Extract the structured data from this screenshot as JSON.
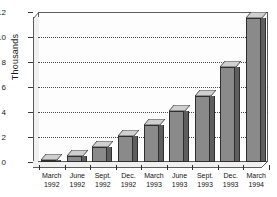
{
  "chart_data": {
    "type": "bar",
    "title": "",
    "subtitle": "",
    "xlabel": "",
    "ylabel": "Thousands",
    "categories": [
      "March\n1992",
      "June\n1992",
      "Sept.\n1992",
      "Dec.\n1992",
      "March\n1993",
      "June\n1993",
      "Sept.\n1993",
      "Dec.\n1993",
      "March\n1994"
    ],
    "category_lines": [
      [
        "March",
        "1992"
      ],
      [
        "June",
        "1992"
      ],
      [
        "Sept.",
        "1992"
      ],
      [
        "Dec.",
        "1992"
      ],
      [
        "March",
        "1993"
      ],
      [
        "June",
        "1993"
      ],
      [
        "Sept.",
        "1993"
      ],
      [
        "Dec.",
        "1993"
      ],
      [
        "March",
        "1994"
      ]
    ],
    "values": [
      0.2,
      0.5,
      1.2,
      2.1,
      3.0,
      4.1,
      5.3,
      7.6,
      11.5
    ],
    "ylim": [
      0,
      12
    ],
    "yticks": [
      0,
      2,
      4,
      6,
      8,
      10,
      12
    ],
    "ytick_labels": [
      "0",
      "2",
      "4",
      "6",
      "8",
      "10",
      "12"
    ],
    "grid": true,
    "grid_axis": "y",
    "grid_style": "dotted",
    "legend": false,
    "legend_position": "none",
    "style": "3d-bar",
    "bar_color": "#8a8a8a",
    "bar_side_color": "#5e5e5e",
    "bar_top_color": "#d0d0d0",
    "bar_edge_color": "#2e2e2e",
    "plot_background": "#fdfdfd",
    "axis_color": "#5c5c5c",
    "grid_color": "#4a4a4a"
  }
}
